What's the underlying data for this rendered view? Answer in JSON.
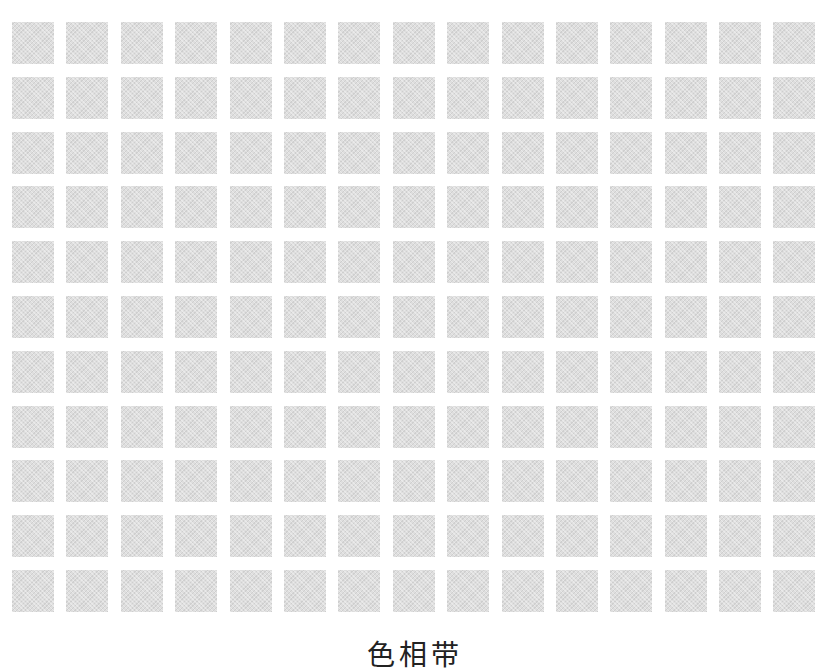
{
  "grid": {
    "rows": 11,
    "columns": 15,
    "cell_color": "#dedede",
    "background": "#ffffff"
  },
  "caption": "色相带"
}
